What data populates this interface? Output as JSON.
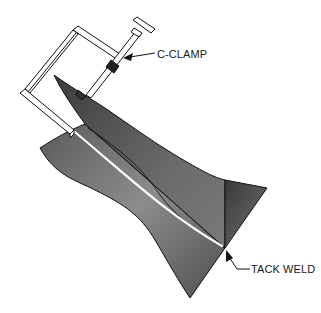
{
  "figure": {
    "labels": {
      "c_clamp": "C-CLAMP",
      "tack_weld": "TACK WELD"
    },
    "colors": {
      "plate_dark": "#4a4a4a",
      "plate_mid": "#6e6e6e",
      "plate_light": "#8a8a8a",
      "outline": "#111111",
      "weld_seam": "#ffffff",
      "clamp_fill": "#ffffff"
    }
  }
}
